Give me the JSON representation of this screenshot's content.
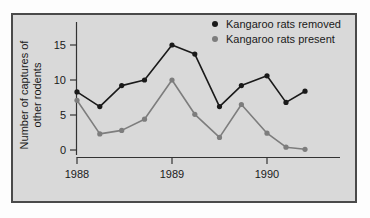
{
  "chart_data": {
    "type": "line",
    "title": "",
    "subtitle": "",
    "xlabel": "",
    "ylabel": "Number of captures of other rodents",
    "ylabel_line1": "Number of captures of",
    "ylabel_line2": "other rodents",
    "grid": false,
    "legend_position": "top-right",
    "xlim": [
      1987.78,
      1990.45
    ],
    "ylim": [
      -0.9,
      17.0
    ],
    "xticks": [
      1988,
      1989,
      1990
    ],
    "xtick_labels": [
      "1988",
      "1989",
      "1990"
    ],
    "yticks": [
      0,
      5,
      10,
      15
    ],
    "ytick_labels": [
      "0",
      "5",
      "10",
      "15"
    ],
    "x": [
      1988.0,
      1988.24,
      1988.47,
      1988.71,
      1989.0,
      1989.24,
      1989.5,
      1989.73,
      1990.0,
      1990.2,
      1990.4
    ],
    "series": [
      {
        "name": "Kangaroo rats removed",
        "color": "#1a1a1a",
        "marker": "circle",
        "values": [
          8.3,
          6.2,
          9.2,
          10.0,
          15.0,
          13.7,
          6.2,
          9.2,
          10.6,
          6.8,
          8.4
        ]
      },
      {
        "name": "Kangaroo rats present",
        "color": "#7d7d7d",
        "marker": "circle",
        "values": [
          7.1,
          2.3,
          2.8,
          4.4,
          10.0,
          5.1,
          1.8,
          6.5,
          2.4,
          0.4,
          0.1
        ]
      }
    ]
  },
  "legend": {
    "items": [
      {
        "label": "Kangaroo rats removed",
        "color": "#1a1a1a"
      },
      {
        "label": "Kangaroo rats present",
        "color": "#7d7d7d"
      }
    ]
  },
  "colors": {
    "panel_background": "#d9d9d9",
    "panel_border": "#4a4a4a",
    "page_background": "#fdfdfd",
    "axis": "#333333",
    "text": "#1a1a1a",
    "series_removed": "#1a1a1a",
    "series_present": "#7d7d7d"
  }
}
